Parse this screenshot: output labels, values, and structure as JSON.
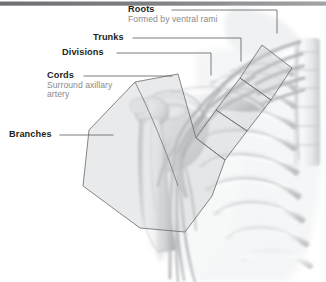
{
  "figure": {
    "top_bar": {
      "color_left": "#6f7073",
      "color_right": "#9b9c9e"
    },
    "palette": {
      "label_title": "#231f20",
      "label_subtitle": "#8a8a8d",
      "leader_line": "#6d6e71",
      "overlay_fill": "#c9cbcd",
      "overlay_stroke": "#75777a",
      "bone_light": "#f2f3f4",
      "bone_mid": "#d6d8da",
      "bone_shadow": "#b9bbbe",
      "background": "#ffffff"
    },
    "labels": [
      {
        "id": "roots",
        "title": "Roots",
        "subtitle": "Formed by ventral rami"
      },
      {
        "id": "trunks",
        "title": "Trunks",
        "subtitle": ""
      },
      {
        "id": "divisions",
        "title": "Divisions",
        "subtitle": ""
      },
      {
        "id": "cords",
        "title": "Cords",
        "subtitle_line1": "Surround axillary",
        "subtitle_line2": "artery"
      },
      {
        "id": "branches",
        "title": "Branches",
        "subtitle": ""
      }
    ]
  }
}
